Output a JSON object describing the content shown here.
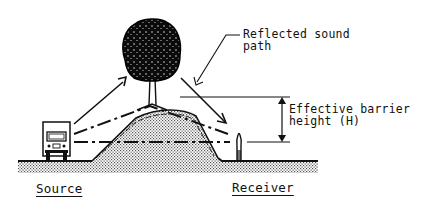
{
  "diagram": {
    "labels": {
      "reflected_path_line1": "Reflected sound",
      "reflected_path_line2": "path",
      "barrier_height_line1": "Effective barrier",
      "barrier_height_line2": "height (H)",
      "source": "Source",
      "receiver": "Receiver"
    },
    "elements": {
      "tree": "tree",
      "berm": "earth berm",
      "truck": "truck (noise source)",
      "person": "person (receiver)"
    },
    "colors": {
      "ink": "#111111",
      "ground_fill": "#bdbdbd",
      "background": "#ffffff"
    }
  }
}
